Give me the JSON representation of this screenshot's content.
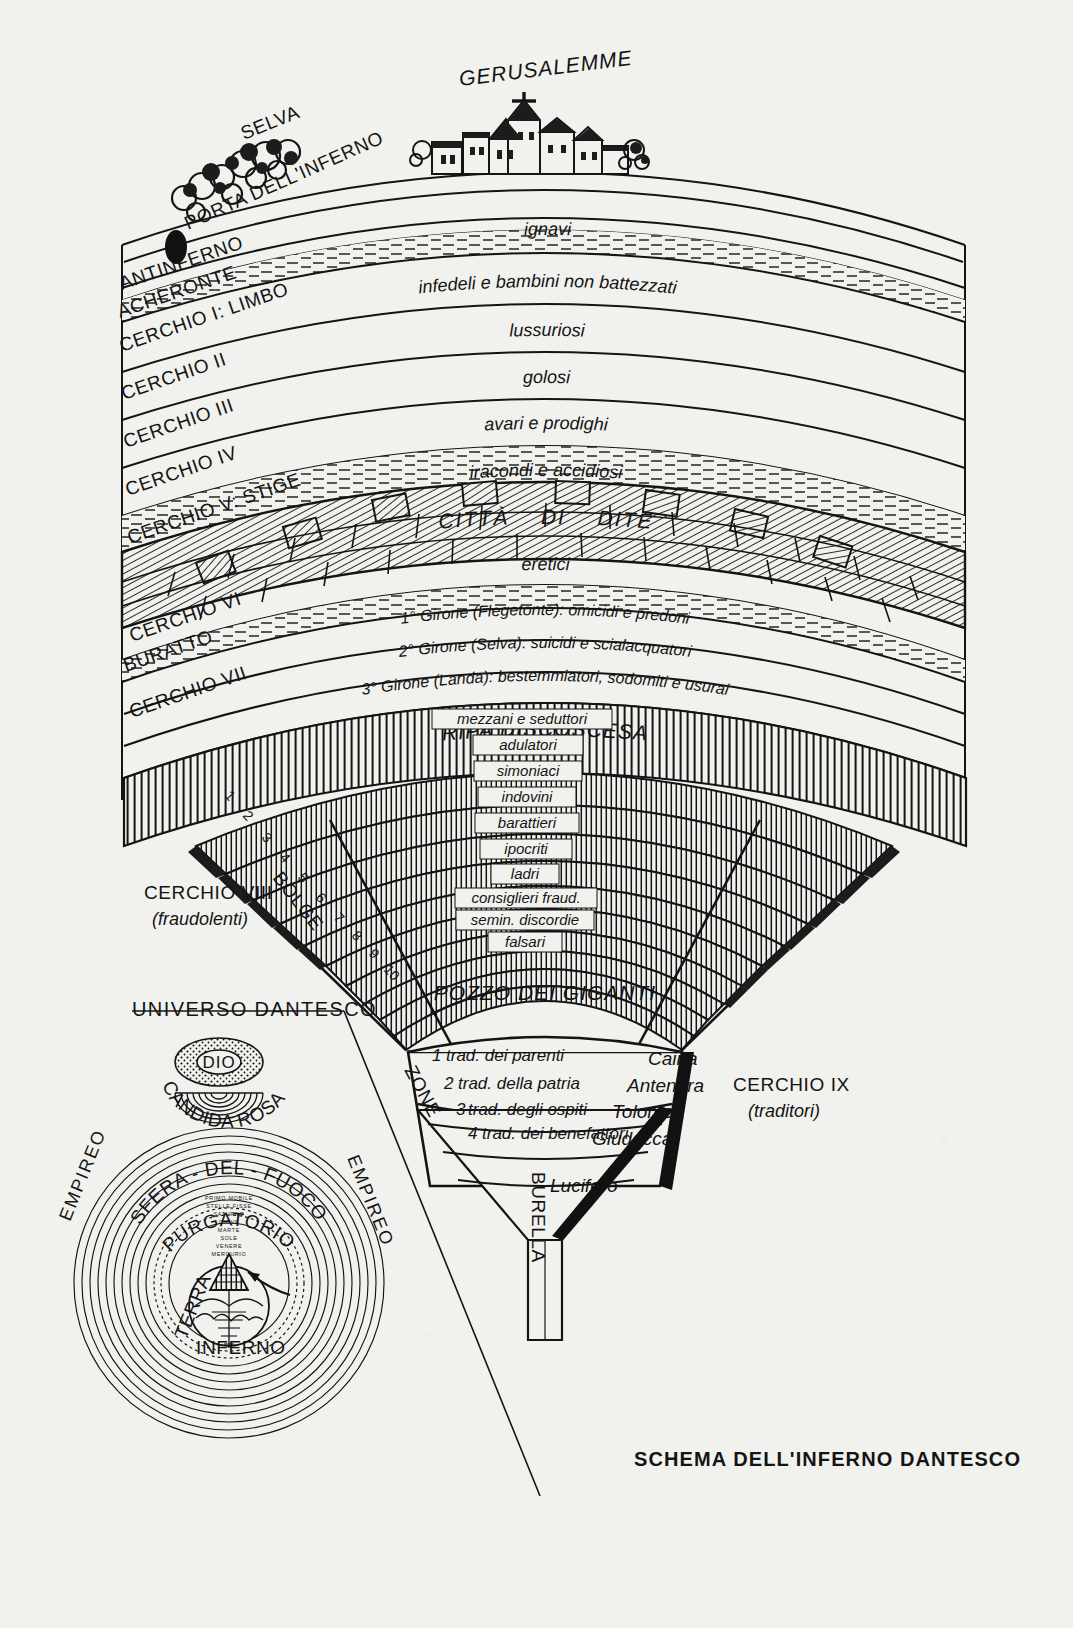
{
  "title": "SCHEMA DELL'INFERNO DANTESCO",
  "surface": {
    "jerusalem": "GERUSALEMME",
    "forest": "SELVA",
    "gate": "PORTA DELL'INFERNO"
  },
  "circles": [
    {
      "id": "antinferno",
      "label": "ANTINFERNO",
      "sinners": "ignavi"
    },
    {
      "id": "acheronte",
      "label": "ACHERONTE",
      "sinners": ""
    },
    {
      "id": "c1",
      "label": "CERCHIO I: LIMBO",
      "sinners": "infedeli e bambini non battezzati"
    },
    {
      "id": "c2",
      "label": "CERCHIO II",
      "sinners": "lussuriosi"
    },
    {
      "id": "c3",
      "label": "CERCHIO III",
      "sinners": "golosi"
    },
    {
      "id": "c4",
      "label": "CERCHIO IV",
      "sinners": "avari e prodighi"
    },
    {
      "id": "c5",
      "label": "CERCHIO V: STIGE",
      "sinners": "iracondi  e  accidiosi"
    },
    {
      "id": "c6",
      "label": "CERCHIO VI",
      "sinners": "eretici"
    },
    {
      "id": "buratto",
      "label": "BURATTO",
      "sinners": ""
    },
    {
      "id": "c7",
      "label": "CERCHIO VII",
      "sinners": ""
    }
  ],
  "city_of_dis": {
    "word1": "CITTÀ",
    "word2": "DI",
    "word3": "DITE"
  },
  "circle7_gironi": [
    "1° Girone (Flegetonte): omicidi e predoni",
    "2° Girone (Selva): suicidi e scialacquatori",
    "3° Girone (Landa): bestemmiatori, sodomiti e usurai"
  ],
  "ripa": "RIPA   DISCOSCESA",
  "circle8": {
    "label": "CERCHIO VIII",
    "sublabel": "(fraudolenti)",
    "bolge_word": "BOLGE",
    "bolge": [
      {
        "n": "1",
        "name": "mezzani e seduttori"
      },
      {
        "n": "2",
        "name": "adulatori"
      },
      {
        "n": "3",
        "name": "simoniaci"
      },
      {
        "n": "4",
        "name": "indovini"
      },
      {
        "n": "5",
        "name": "barattieri"
      },
      {
        "n": "6",
        "name": "ipocriti"
      },
      {
        "n": "7",
        "name": "ladri"
      },
      {
        "n": "8",
        "name": "consiglieri fraud."
      },
      {
        "n": "9",
        "name": "semin. discordie"
      },
      {
        "n": "10",
        "name": "falsari"
      }
    ]
  },
  "pozzo": "POZZO DEI GIGANTI",
  "circle9": {
    "label": "CERCHIO IX",
    "sublabel": "(traditori)",
    "zone_word": "ZONE",
    "zones": [
      {
        "n": "1",
        "sin": "trad.  dei parenti",
        "name": "Caina"
      },
      {
        "n": "2",
        "sin": "trad. della patria",
        "name": "Antenora"
      },
      {
        "n": "3",
        "sin": "trad. degli ospiti",
        "name": "Tolomea"
      },
      {
        "n": "4",
        "sin": "trad. dei benefattori",
        "name": "Giudecca"
      }
    ],
    "lucifero": "Lucifero",
    "burella": "BURELLA"
  },
  "inset": {
    "title": "UNIVERSO DANTESCO",
    "god": "DIO",
    "rose": "CANDIDA ROSA",
    "empireo_left": "EMPIREO",
    "empireo_right": "EMPIREO",
    "spheres": [
      "PRIMO MOBILE",
      "STELLE FISSE",
      "SATURNO",
      "GIOVE",
      "MARTE",
      "SOLE",
      "VENERE",
      "MERCURIO"
    ],
    "fire": "SFERA - DEL - FUOCO",
    "purgatorio": "PURGATORIO",
    "terra": "TERRA",
    "inferno": "INFERNO"
  },
  "colors": {
    "paper": "#f1f1ee",
    "ink": "#141414"
  }
}
